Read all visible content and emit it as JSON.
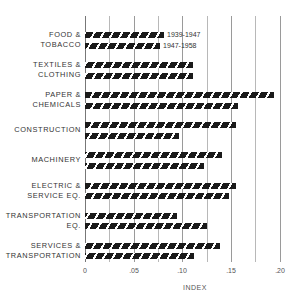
{
  "chart_data": {
    "type": "bar",
    "orientation": "horizontal",
    "title": "",
    "xlabel": "INDEX",
    "ylabel": "",
    "xlim": [
      0,
      0.2
    ],
    "grid": true,
    "grid_step": 0.025,
    "x_ticks": [
      "0",
      ".05",
      ".10",
      ".15",
      ".20"
    ],
    "legend_position": "inline, next to first category bars",
    "categories": [
      "FOOD & TOBACCO",
      "TEXTILES & CLOTHING",
      "PAPER & CHEMICALS",
      "CONSTRUCTION",
      "MACHINERY",
      "ELECTRIC & SERVICE EQ.",
      "TRANSPORTATION EQ.",
      "SERVICES & TRANSPORTATION"
    ],
    "series": [
      {
        "name": "1939-1947",
        "values": [
          0.081,
          0.111,
          0.194,
          0.155,
          0.141,
          0.155,
          0.094,
          0.139
        ]
      },
      {
        "name": "1947-1958",
        "values": [
          0.077,
          0.111,
          0.157,
          0.097,
          0.122,
          0.148,
          0.125,
          0.112
        ]
      }
    ],
    "bar_pattern": "black diagonal hatch"
  },
  "labels": {
    "categories": [
      [
        "FOOD &",
        "TOBACCO"
      ],
      [
        "TEXTILES &",
        "CLOTHING"
      ],
      [
        "PAPER &",
        "CHEMICALS"
      ],
      [
        "CONSTRUCTION"
      ],
      [
        "MACHINERY"
      ],
      [
        "ELECTRIC &",
        "SERVICE EQ."
      ],
      [
        "TRANSPORTATION",
        "EQ."
      ],
      [
        "SERVICES &",
        "TRANSPORTATION"
      ]
    ],
    "legend_1": "1939-1947",
    "legend_2": "1947-1958",
    "xlabel": "INDEX",
    "ticks": [
      "0",
      ".05",
      ".10",
      ".15",
      ".20"
    ]
  }
}
